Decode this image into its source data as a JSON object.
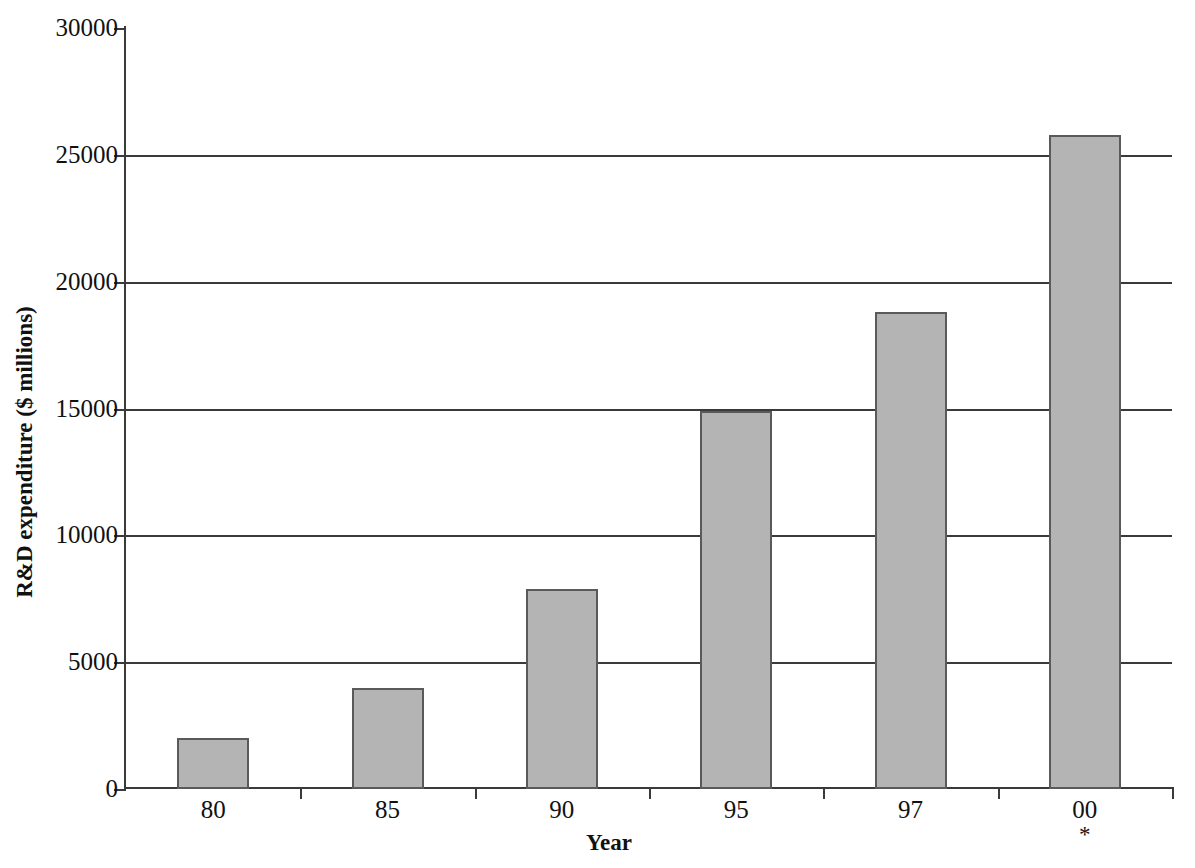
{
  "chart_data": {
    "type": "bar",
    "title": "",
    "xlabel": "Year",
    "ylabel": "R&D expenditure ($ millions)",
    "categories": [
      "80",
      "85",
      "90",
      "95",
      "97",
      "00"
    ],
    "values": [
      2000,
      4000,
      7900,
      14900,
      18800,
      25800
    ],
    "category_notes": [
      "",
      "",
      "",
      "",
      "",
      "*"
    ],
    "ylim": [
      0,
      30000
    ],
    "ytick_values": [
      0,
      5000,
      10000,
      15000,
      20000,
      25000,
      30000
    ],
    "ytick_labels": [
      "0",
      "5000",
      "10000",
      "15000",
      "20000",
      "25000",
      "30000"
    ],
    "grid": "horizontal",
    "legend": "none",
    "bar_fill_color": "#b4b4b4",
    "bar_edge_color": "#5a5a5a",
    "axis_color": "#3a3a3a",
    "background_color": "#ffffff"
  }
}
